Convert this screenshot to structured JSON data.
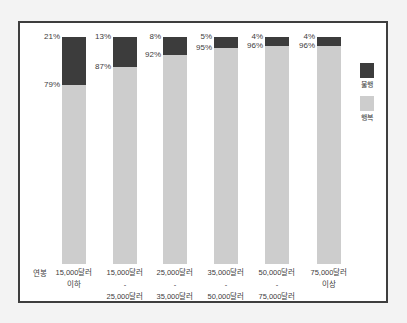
{
  "figure": {
    "background": "#f3f3f3",
    "frame_border_color": "#3e3e3e",
    "frame_background": "#ffffff",
    "text_color": "#3d3d3d"
  },
  "chart_data": {
    "type": "bar",
    "stacked": true,
    "orientation": "vertical",
    "unit": "%",
    "title": "",
    "x_axis_prefix": "연봉",
    "categories": [
      [
        "15,000달러",
        "이하"
      ],
      [
        "15,000달러",
        "-",
        "25,000달러"
      ],
      [
        "25,000달러",
        "-",
        "35,000달러"
      ],
      [
        "35,000달러",
        "-",
        "50,000달러"
      ],
      [
        "50,000달러",
        "-",
        "75,000달러"
      ],
      [
        "75,000달러",
        "이상"
      ]
    ],
    "series": [
      {
        "name": "불행",
        "color": "#3c3c3c",
        "values": [
          21,
          13,
          8,
          5,
          4,
          4
        ]
      },
      {
        "name": "행복",
        "color": "#cdcdcd",
        "values": [
          79,
          87,
          92,
          95,
          96,
          96
        ]
      }
    ],
    "ylim": [
      0,
      100
    ],
    "gridlines": false,
    "legend_position": "right",
    "value_label_position": "left-of-bar"
  }
}
